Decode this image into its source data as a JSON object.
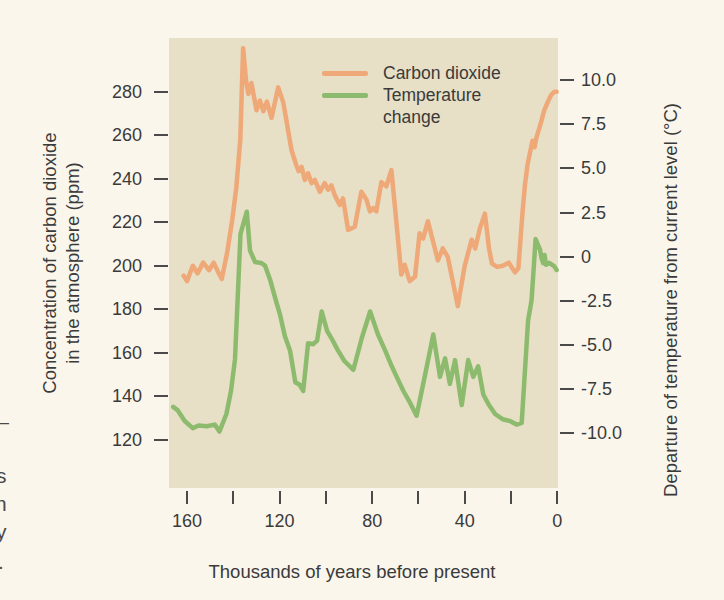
{
  "page": {
    "edge_fragments": [
      "—",
      "s",
      "n",
      "y",
      "."
    ]
  },
  "colors": {
    "page_background": "#faf6ec",
    "plot_background": "#e7dfc6",
    "co2_line": "#efa878",
    "temperature_line": "#8dbb6d",
    "text": "#3a3a3a",
    "tick": "#4a4a4a"
  },
  "chart_data": {
    "type": "line",
    "xlabel": "Thousands of years before present",
    "ylabel_left_line1": "Concentration of carbon dioxide",
    "ylabel_left_line2": "in the atmosphere (ppm)",
    "ylabel_right": "Departure of temperature from current level (°C)",
    "legend": [
      {
        "label": "Carbon dioxide",
        "color": "#efa878"
      },
      {
        "label": "Temperature change",
        "color": "#8dbb6d"
      }
    ],
    "x_axis": {
      "range": [
        167.8,
        -0.3
      ],
      "ticks": [
        {
          "value": 160,
          "label": "160"
        },
        {
          "value": 140,
          "label": ""
        },
        {
          "value": 120,
          "label": "120"
        },
        {
          "value": 100,
          "label": ""
        },
        {
          "value": 80,
          "label": "80"
        },
        {
          "value": 60,
          "label": ""
        },
        {
          "value": 40,
          "label": "40"
        },
        {
          "value": 20,
          "label": ""
        },
        {
          "value": 0,
          "label": "0"
        }
      ]
    },
    "left_axis": {
      "range": [
        304.7,
        97.9
      ],
      "ticks": [
        {
          "value": 280,
          "label": "280"
        },
        {
          "value": 260,
          "label": "260"
        },
        {
          "value": 240,
          "label": "240"
        },
        {
          "value": 220,
          "label": "220"
        },
        {
          "value": 200,
          "label": "200"
        },
        {
          "value": 180,
          "label": "180"
        },
        {
          "value": 160,
          "label": "160"
        },
        {
          "value": 140,
          "label": "140"
        },
        {
          "value": 120,
          "label": "120"
        }
      ]
    },
    "right_axis": {
      "range": [
        12.38,
        -13.09
      ],
      "ticks": [
        {
          "value": 10,
          "label": "10.0"
        },
        {
          "value": 7.5,
          "label": "7.5"
        },
        {
          "value": 5,
          "label": "5.0"
        },
        {
          "value": 2.5,
          "label": "2.5"
        },
        {
          "value": 0,
          "label": "0"
        },
        {
          "value": -2.5,
          "label": "-2.5"
        },
        {
          "value": -5,
          "label": "-5.0"
        },
        {
          "value": -7.5,
          "label": "-7.5"
        },
        {
          "value": -10,
          "label": "-10.0"
        }
      ]
    },
    "series": [
      {
        "id": "co2",
        "name": "Carbon dioxide",
        "axis": "left",
        "unit": "ppm",
        "color": "#efa878",
        "points": [
          [
            161.5,
            195.5
          ],
          [
            160,
            193
          ],
          [
            157.5,
            200
          ],
          [
            155.5,
            196.5
          ],
          [
            153,
            201.5
          ],
          [
            150.5,
            198
          ],
          [
            148.5,
            201.5
          ],
          [
            146.5,
            197
          ],
          [
            145,
            194
          ],
          [
            142.7,
            206
          ],
          [
            140.5,
            221
          ],
          [
            138.7,
            236
          ],
          [
            137,
            258
          ],
          [
            135.8,
            300
          ],
          [
            134.5,
            285
          ],
          [
            133.5,
            279
          ],
          [
            132.2,
            284
          ],
          [
            130,
            271.5
          ],
          [
            128.5,
            276
          ],
          [
            127,
            271
          ],
          [
            125.5,
            275.5
          ],
          [
            123.5,
            268
          ],
          [
            120.6,
            282
          ],
          [
            118.4,
            275
          ],
          [
            114.8,
            253
          ],
          [
            112.7,
            246
          ],
          [
            111.8,
            243.5
          ],
          [
            110.5,
            245.5
          ],
          [
            109.1,
            239.5
          ],
          [
            107.7,
            242.5
          ],
          [
            106.2,
            238
          ],
          [
            104.8,
            239.5
          ],
          [
            102.6,
            234
          ],
          [
            100.5,
            238
          ],
          [
            99,
            235
          ],
          [
            97.6,
            237
          ],
          [
            96.2,
            232.5
          ],
          [
            94,
            228
          ],
          [
            92.6,
            231
          ],
          [
            90.4,
            216.5
          ],
          [
            87.5,
            218
          ],
          [
            84.7,
            234
          ],
          [
            82.5,
            230.5
          ],
          [
            81,
            225
          ],
          [
            79.6,
            226.5
          ],
          [
            78.2,
            225
          ],
          [
            76,
            238.5
          ],
          [
            73.9,
            236.5
          ],
          [
            71.7,
            244
          ],
          [
            69.6,
            221
          ],
          [
            67.4,
            196
          ],
          [
            66,
            200.5
          ],
          [
            63.8,
            193
          ],
          [
            61.5,
            195
          ],
          [
            59.5,
            215
          ],
          [
            58,
            212.5
          ],
          [
            55.9,
            220.5
          ],
          [
            51.6,
            202.5
          ],
          [
            49.5,
            208
          ],
          [
            47.3,
            204
          ],
          [
            45,
            192
          ],
          [
            43,
            181.5
          ],
          [
            40,
            200
          ],
          [
            37,
            212
          ],
          [
            35.5,
            208
          ],
          [
            33.5,
            217
          ],
          [
            31.3,
            224
          ],
          [
            29.5,
            208
          ],
          [
            28.2,
            201
          ],
          [
            26,
            199.5
          ],
          [
            23.5,
            200
          ],
          [
            21,
            201.5
          ],
          [
            18.3,
            197
          ],
          [
            16.8,
            199
          ],
          [
            15,
            225
          ],
          [
            14,
            237
          ],
          [
            12.8,
            247
          ],
          [
            10.7,
            257.5
          ],
          [
            9.8,
            254.5
          ],
          [
            9,
            259
          ],
          [
            7,
            266
          ],
          [
            5.6,
            271.5
          ],
          [
            4,
            275.5
          ],
          [
            2.7,
            278.5
          ],
          [
            1.2,
            280
          ],
          [
            0.3,
            280
          ]
        ]
      },
      {
        "id": "temperature",
        "name": "Temperature change",
        "axis": "right",
        "unit": "°C",
        "color": "#8dbb6d",
        "points": [
          [
            166,
            -8.5
          ],
          [
            164,
            -8.7
          ],
          [
            161,
            -9.3
          ],
          [
            157.5,
            -9.7
          ],
          [
            155,
            -9.55
          ],
          [
            151.5,
            -9.6
          ],
          [
            148,
            -9.5
          ],
          [
            146,
            -9.9
          ],
          [
            143,
            -8.9
          ],
          [
            141,
            -7.6
          ],
          [
            139.3,
            -5.8
          ],
          [
            136.9,
            1.3
          ],
          [
            134.2,
            2.55
          ],
          [
            132.8,
            0.35
          ],
          [
            130.6,
            -0.3
          ],
          [
            128,
            -0.35
          ],
          [
            126.3,
            -0.5
          ],
          [
            124.1,
            -1.3
          ],
          [
            122,
            -2.3
          ],
          [
            119.8,
            -3.3
          ],
          [
            117.7,
            -4.5
          ],
          [
            115.5,
            -5.3
          ],
          [
            113.2,
            -7.1
          ],
          [
            111.3,
            -7.25
          ],
          [
            109.8,
            -7.6
          ],
          [
            107.7,
            -4.9
          ],
          [
            105.5,
            -4.95
          ],
          [
            103.8,
            -4.75
          ],
          [
            101.8,
            -3.1
          ],
          [
            99.5,
            -4.2
          ],
          [
            97,
            -4.75
          ],
          [
            94.8,
            -5.3
          ],
          [
            92,
            -5.9
          ],
          [
            88.1,
            -6.4
          ],
          [
            84.5,
            -4.6
          ],
          [
            80.9,
            -3.1
          ],
          [
            77.5,
            -4.4
          ],
          [
            74.4,
            -5.3
          ],
          [
            71.5,
            -6.2
          ],
          [
            69.4,
            -6.8
          ],
          [
            66.5,
            -7.6
          ],
          [
            63.5,
            -8.3
          ],
          [
            60.8,
            -9
          ],
          [
            57,
            -6.6
          ],
          [
            53.6,
            -4.4
          ],
          [
            50.7,
            -6.8
          ],
          [
            48.5,
            -5.75
          ],
          [
            46.4,
            -7.2
          ],
          [
            44.2,
            -5.85
          ],
          [
            41.3,
            -8.4
          ],
          [
            38.5,
            -5.85
          ],
          [
            36.3,
            -6.8
          ],
          [
            34.2,
            -6.2
          ],
          [
            32,
            -7.8
          ],
          [
            29.5,
            -8.4
          ],
          [
            26.9,
            -8.9
          ],
          [
            23.5,
            -9.2
          ],
          [
            20.5,
            -9.3
          ],
          [
            17.6,
            -9.5
          ],
          [
            15.4,
            -9.4
          ],
          [
            12.6,
            -3.6
          ],
          [
            11.1,
            -2.45
          ],
          [
            9.4,
            1
          ],
          [
            7.5,
            0.4
          ],
          [
            6.8,
            -0.1
          ],
          [
            6.1,
            -0.37
          ],
          [
            5.5,
            0.1
          ],
          [
            4.9,
            -0.45
          ],
          [
            3.5,
            -0.35
          ],
          [
            1.3,
            -0.55
          ],
          [
            0.3,
            -0.75
          ]
        ]
      }
    ]
  }
}
